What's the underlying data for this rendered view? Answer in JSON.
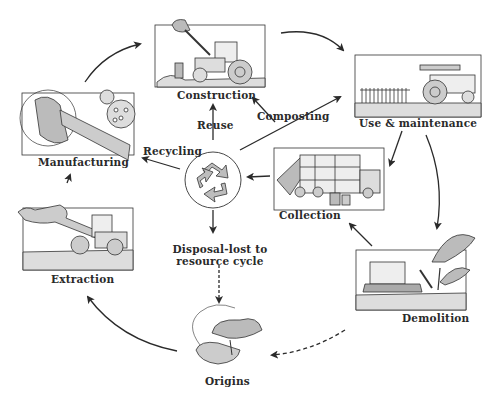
{
  "diagram": {
    "stages": {
      "construction": "Construction",
      "use_maintenance": "Use & maintenance",
      "manufacturing": "Manufacturing",
      "collection": "Collection",
      "extraction": "Extraction",
      "demolition": "Demolition",
      "origins": "Origins"
    },
    "flows": {
      "reuse": "Reuse",
      "composting": "Composting",
      "recycling": "Recycling",
      "disposal_line1": "Disposal-lost to",
      "disposal_line2": "resource cycle"
    },
    "center_icon": "recycle-icon",
    "colors": {
      "ink": "#2a2a2a",
      "fill_gray": "#bdbdbd",
      "background": "#ffffff"
    }
  }
}
